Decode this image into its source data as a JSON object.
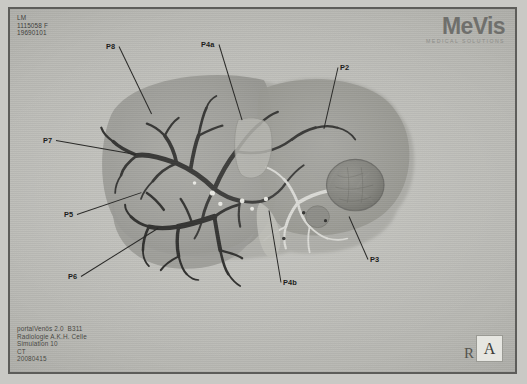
{
  "header": {
    "patient_meta": "LM\n1115058 F\n19690101"
  },
  "logo": {
    "name": "MeVis",
    "tagline": "MEDICAL SOLUTIONS"
  },
  "footer": {
    "study_meta": "portalVenös 2.0  B311\nRadiologie A.K.H. Celle\nSimulation 10\nCT\n20080415"
  },
  "orientation": {
    "right_marker": "R",
    "anterior_marker": "A"
  },
  "annotations": [
    {
      "label": "P8",
      "lx": 104,
      "ly": 40,
      "tipx": 150,
      "tipy": 112
    },
    {
      "label": "P4a",
      "lx": 199,
      "ly": 38,
      "tipx": 240,
      "tipy": 118
    },
    {
      "label": "P2",
      "lx": 338,
      "ly": 61,
      "tipx": 322,
      "tipy": 126
    },
    {
      "label": "P7",
      "lx": 41,
      "ly": 134,
      "tipx": 134,
      "tipy": 152
    },
    {
      "label": "P5",
      "lx": 62,
      "ly": 208,
      "tipx": 140,
      "tipy": 190
    },
    {
      "label": "P6",
      "lx": 66,
      "ly": 270,
      "tipx": 156,
      "tipy": 226
    },
    {
      "label": "P4b",
      "lx": 281,
      "ly": 276,
      "tipx": 267,
      "tipy": 208
    },
    {
      "label": "P3",
      "lx": 368,
      "ly": 253,
      "tipx": 347,
      "tipy": 214
    }
  ],
  "scene": {
    "description": "3D portal-venous liver vessel reconstruction, grayscale volume rendering",
    "parenchyma_color": "#9a9a95",
    "vessel_dark_color": "#2e2e2c",
    "vessel_light_color": "#d8d8d3",
    "lesion_color": "#7e7e79",
    "background_color": "#bcbcb7"
  }
}
